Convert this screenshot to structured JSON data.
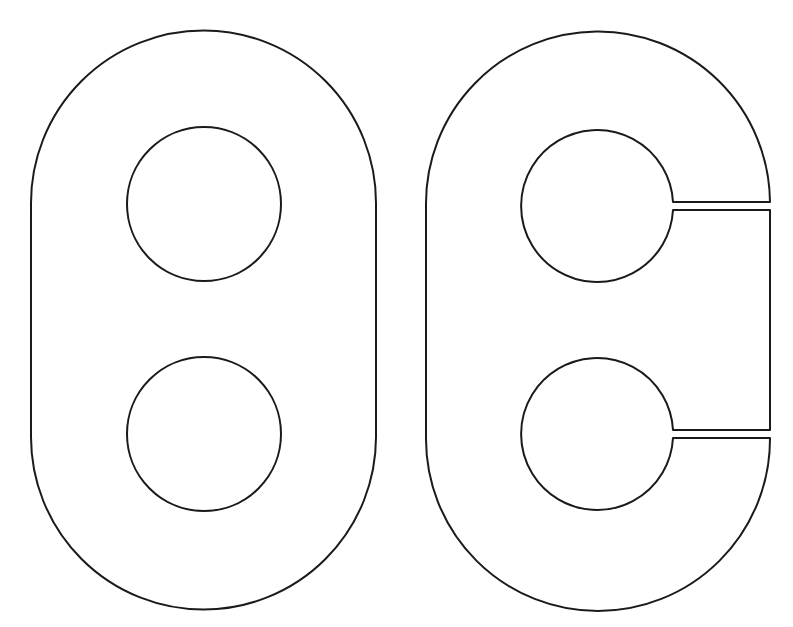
{
  "diagram": {
    "background": "#ffffff",
    "stroke_color": "#1a1a1a",
    "shapes": [
      {
        "name": "closed-stadium-plate",
        "description": "Stadium (obround) outline with two circular holes",
        "outer": {
          "left": 31,
          "right": 376,
          "top_arc_center_y": 203,
          "bottom_arc_center_y": 437,
          "radius": 172.5
        },
        "holes": [
          {
            "cx": 204,
            "cy": 204,
            "r": 77
          },
          {
            "cx": 204,
            "cy": 434,
            "r": 77
          }
        ]
      },
      {
        "name": "slit-stadium-plate",
        "description": "Stadium outline with two circular holes, each opened to the right edge by a narrow slit",
        "outer": {
          "left": 426,
          "right": 770,
          "top_arc_center_y": 205,
          "bottom_arc_center_y": 439,
          "radius": 172
        },
        "holes": [
          {
            "cx": 597,
            "cy": 206,
            "r": 76
          },
          {
            "cx": 597,
            "cy": 434,
            "r": 76
          }
        ],
        "slits": [
          {
            "y_top": 202,
            "y_bottom": 210,
            "x_start": 673,
            "x_end": 770
          },
          {
            "y_top": 430,
            "y_bottom": 438,
            "x_start": 673,
            "x_end": 770
          }
        ]
      }
    ]
  }
}
